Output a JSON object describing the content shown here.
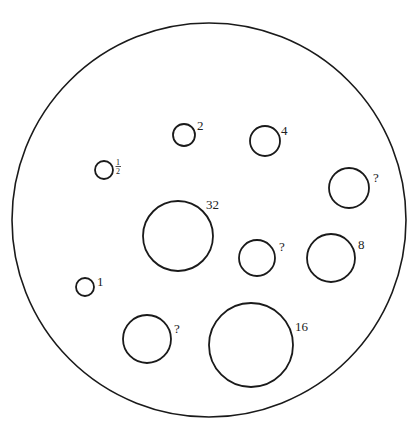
{
  "diagram": {
    "outer": {
      "cx": 209,
      "cy": 220,
      "r": 197
    },
    "stroke_color": "#1a1a1a",
    "circles": [
      {
        "id": "half",
        "cx": 104,
        "cy": 170,
        "r": 9,
        "label": "½",
        "label_num": "1",
        "label_den": "2",
        "lx": 116,
        "ly": 166
      },
      {
        "id": "two",
        "cx": 184,
        "cy": 135,
        "r": 11,
        "label": "2",
        "lx": 197,
        "ly": 130
      },
      {
        "id": "four",
        "cx": 265,
        "cy": 141,
        "r": 15,
        "label": "4",
        "lx": 281,
        "ly": 135
      },
      {
        "id": "unknown-top-right",
        "cx": 349,
        "cy": 188,
        "r": 20,
        "label": "?",
        "lx": 373,
        "ly": 182
      },
      {
        "id": "thirty-two",
        "cx": 178,
        "cy": 236,
        "r": 35,
        "label": "32",
        "lx": 206,
        "ly": 209
      },
      {
        "id": "unknown-middle",
        "cx": 257,
        "cy": 258,
        "r": 18,
        "label": "?",
        "lx": 279,
        "ly": 251
      },
      {
        "id": "eight",
        "cx": 331,
        "cy": 258,
        "r": 24,
        "label": "8",
        "lx": 358,
        "ly": 249
      },
      {
        "id": "one",
        "cx": 85,
        "cy": 287,
        "r": 9,
        "label": "1",
        "lx": 97,
        "ly": 286
      },
      {
        "id": "unknown-bottom",
        "cx": 147,
        "cy": 339,
        "r": 24,
        "label": "?",
        "lx": 174,
        "ly": 333
      },
      {
        "id": "sixteen",
        "cx": 251,
        "cy": 345,
        "r": 42,
        "label": "16",
        "lx": 295,
        "ly": 331
      }
    ]
  }
}
